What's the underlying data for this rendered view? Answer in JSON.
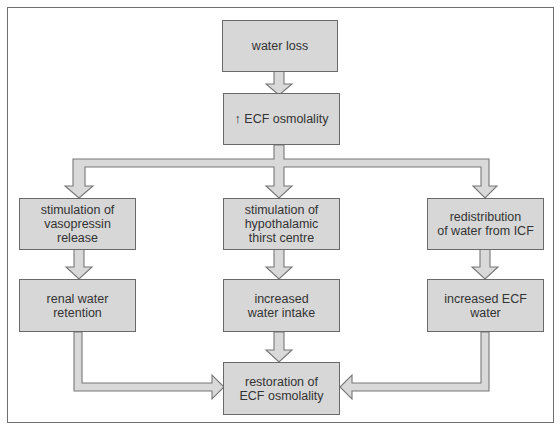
{
  "diagram": {
    "nodes": {
      "water_loss": "water loss",
      "ecf_osmolality_up": "↑ ECF osmolality",
      "vasopressin": "stimulation of\nvasopressin release",
      "thirst": "stimulation of\nhypothalamic\nthirst centre",
      "redistribution": "redistribution\nof water from ICF",
      "renal_retention": "renal water\nretention",
      "water_intake": "increased\nwater intake",
      "ecf_water": "increased ECF\nwater",
      "restoration": "restoration of\nECF osmolality"
    },
    "edges": [
      {
        "from": "water_loss",
        "to": "ecf_osmolality_up"
      },
      {
        "from": "ecf_osmolality_up",
        "to": "vasopressin"
      },
      {
        "from": "ecf_osmolality_up",
        "to": "thirst"
      },
      {
        "from": "ecf_osmolality_up",
        "to": "redistribution"
      },
      {
        "from": "vasopressin",
        "to": "renal_retention"
      },
      {
        "from": "thirst",
        "to": "water_intake"
      },
      {
        "from": "redistribution",
        "to": "ecf_water"
      },
      {
        "from": "renal_retention",
        "to": "restoration"
      },
      {
        "from": "water_intake",
        "to": "restoration"
      },
      {
        "from": "ecf_water",
        "to": "restoration"
      }
    ],
    "colors": {
      "box_fill": "#d7d7d7",
      "box_border": "#6a6a6a",
      "arrow_fill": "#d9d9d9",
      "arrow_stroke": "#777777",
      "frame_border": "#6f6f6f"
    }
  }
}
